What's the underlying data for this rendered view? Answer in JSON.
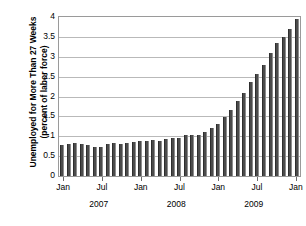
{
  "chart_data": {
    "type": "bar",
    "title": "",
    "xlabel": "",
    "ylabel": "Unemployed for More Than 27 Weeks (percent of labor force)",
    "ylabel_line1": "Unemployed for More Than 27 Weeks",
    "ylabel_line2": "(percent of labor force)",
    "ylim": [
      0,
      4
    ],
    "ytick_labels": [
      "4",
      "3.5",
      "3",
      "2.5",
      "2",
      "1.5",
      "1",
      "0.5",
      "0"
    ],
    "ytick_values": [
      4,
      3.5,
      3,
      2.5,
      2,
      1.5,
      1,
      0.5,
      0
    ],
    "grid": true,
    "legend": "none",
    "xtick_labels": [
      "Jan",
      "Jul",
      "Jan",
      "Jul",
      "Jan",
      "Jul",
      "Jan"
    ],
    "xtick_index": [
      0,
      6,
      12,
      18,
      24,
      30,
      36
    ],
    "year_labels": [
      "2007",
      "2008",
      "2009"
    ],
    "year_center_index": [
      5.5,
      17.5,
      29.5
    ],
    "bar_color": "#4b4b4b",
    "categories": [
      "Jan 2007",
      "Feb 2007",
      "Mar 2007",
      "Apr 2007",
      "May 2007",
      "Jun 2007",
      "Jul 2007",
      "Aug 2007",
      "Sep 2007",
      "Oct 2007",
      "Nov 2007",
      "Dec 2007",
      "Jan 2008",
      "Feb 2008",
      "Mar 2008",
      "Apr 2008",
      "May 2008",
      "Jun 2008",
      "Jul 2008",
      "Aug 2008",
      "Sep 2008",
      "Oct 2008",
      "Nov 2008",
      "Dec 2008",
      "Jan 2009",
      "Feb 2009",
      "Mar 2009",
      "Apr 2009",
      "May 2009",
      "Jun 2009",
      "Jul 2009",
      "Aug 2009",
      "Sep 2009",
      "Oct 2009",
      "Nov 2009",
      "Dec 2009",
      "Jan 2010"
    ],
    "values": [
      0.78,
      0.8,
      0.82,
      0.8,
      0.78,
      0.72,
      0.74,
      0.8,
      0.84,
      0.8,
      0.84,
      0.86,
      0.88,
      0.88,
      0.9,
      0.88,
      0.92,
      0.96,
      0.96,
      1.02,
      1.04,
      1.04,
      1.1,
      1.2,
      1.32,
      1.48,
      1.66,
      1.88,
      2.1,
      2.36,
      2.56,
      2.8,
      3.1,
      3.34,
      3.5,
      3.7,
      3.94
    ]
  }
}
